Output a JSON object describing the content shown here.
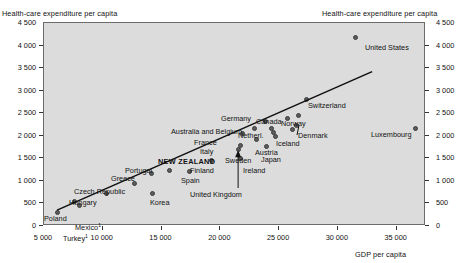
{
  "chart_data": {
    "type": "scatter",
    "title": "",
    "xlabel": "GDP per capita",
    "ylabel": "Health-care expenditure per capita",
    "ylabel_right": "Health-care expenditure per capita",
    "xlim": [
      5000,
      37500
    ],
    "ylim": [
      0,
      4500
    ],
    "xticks": [
      "5 000",
      "10 000",
      "15 000",
      "20 000",
      "25 000",
      "30 000",
      "35 000"
    ],
    "xtick_values": [
      5000,
      10000,
      15000,
      20000,
      25000,
      30000,
      35000
    ],
    "yticks": [
      "0",
      "500",
      "1 000",
      "1 500",
      "2 000",
      "2 500",
      "3 000",
      "3 500",
      "4 000",
      "4 500"
    ],
    "ytick_values": [
      0,
      500,
      1000,
      1500,
      2000,
      2500,
      3000,
      3500,
      4000,
      4500
    ],
    "grid": false,
    "legend": "none",
    "trendline": {
      "x0": 6200,
      "y0": 330,
      "x1": 33000,
      "y1": 3400
    },
    "highlight": "NEW ZEALAND",
    "footnote_marker": "1",
    "points": [
      {
        "label": "Turkey",
        "x": 6200,
        "y": 280,
        "sup": "1",
        "lx": 63,
        "ly": 233,
        "anchor": "below"
      },
      {
        "label": "Poland",
        "x": 7700,
        "y": 520,
        "lx": 44,
        "ly": 214,
        "anchor": "left"
      },
      {
        "label": "Mexico",
        "x": 8100,
        "y": 430,
        "sup": "1",
        "lx": 75,
        "ly": 222,
        "anchor": "right"
      },
      {
        "label": "Hungary",
        "x": 10400,
        "y": 700,
        "lx": 69,
        "ly": 198,
        "anchor": "left"
      },
      {
        "label": "Czech Republic",
        "x": 12800,
        "y": 920,
        "lx": 74,
        "ly": 187,
        "anchor": "left"
      },
      {
        "label": "Greece",
        "x": 14200,
        "y": 1150,
        "lx": 111,
        "ly": 174,
        "anchor": "left"
      },
      {
        "label": "Portugal",
        "x": 15800,
        "y": 1210,
        "lx": 125,
        "ly": 166,
        "anchor": "left"
      },
      {
        "label": "Korea",
        "x": 14300,
        "y": 700,
        "lx": 150,
        "ly": 198,
        "anchor": "right"
      },
      {
        "label": "Spain",
        "x": 17500,
        "y": 1190,
        "lx": 181,
        "ly": 176,
        "anchor": "right"
      },
      {
        "label": "NEW ZEALAND",
        "x": 19300,
        "y": 1430,
        "lx": 158,
        "ly": 157,
        "anchor": "left",
        "bold": true
      },
      {
        "label": "Finland",
        "x": 21800,
        "y": 1480,
        "lx": 190,
        "ly": 166,
        "anchor": "left"
      },
      {
        "label": "Italy",
        "x": 21800,
        "y": 1760,
        "lx": 200,
        "ly": 147,
        "anchor": "left"
      },
      {
        "label": "France",
        "x": 22000,
        "y": 2030,
        "lx": 194,
        "ly": 138,
        "anchor": "left"
      },
      {
        "label": "United Kingdom",
        "x": 21600,
        "y": 1680,
        "lx": 190,
        "ly": 190,
        "anchor": "arrow"
      },
      {
        "label": "Australia and Belgium",
        "x": 23000,
        "y": 2130,
        "lx": 171,
        "ly": 127,
        "anchor": "left"
      },
      {
        "label": "Sweden",
        "x": 23200,
        "y": 1890,
        "lx": 225,
        "ly": 156,
        "anchor": "left"
      },
      {
        "label": "Ireland",
        "x": 24000,
        "y": 1740,
        "lx": 243,
        "ly": 166,
        "anchor": "right"
      },
      {
        "label": "Germany",
        "x": 23900,
        "y": 2300,
        "lx": 221,
        "ly": 114,
        "anchor": "left"
      },
      {
        "label": "Netherl.",
        "x": 24400,
        "y": 2150,
        "lx": 238,
        "ly": 131,
        "anchor": "left"
      },
      {
        "label": "Austria",
        "x": 24600,
        "y": 2060,
        "lx": 255,
        "ly": 148,
        "anchor": "left"
      },
      {
        "label": "Japan",
        "x": 24800,
        "y": 1970,
        "lx": 261,
        "ly": 155,
        "anchor": "left"
      },
      {
        "label": "Canada",
        "x": 25800,
        "y": 2350,
        "lx": 256,
        "ly": 117,
        "anchor": "left"
      },
      {
        "label": "Iceland",
        "x": 26200,
        "y": 2120,
        "lx": 276,
        "ly": 139,
        "anchor": "left"
      },
      {
        "label": "Denmark",
        "x": 26600,
        "y": 2200,
        "lx": 298,
        "ly": 131,
        "anchor": "leader"
      },
      {
        "label": "Norway",
        "x": 26700,
        "y": 2420,
        "lx": 281,
        "ly": 119,
        "anchor": "left"
      },
      {
        "label": "Switzerland",
        "x": 27400,
        "y": 2790,
        "lx": 308,
        "ly": 101,
        "anchor": "right"
      },
      {
        "label": "United States",
        "x": 31600,
        "y": 4150,
        "lx": 365,
        "ly": 43,
        "anchor": "right"
      },
      {
        "label": "Luxembourg",
        "x": 36700,
        "y": 2130,
        "lx": 371,
        "ly": 130,
        "anchor": "left"
      }
    ]
  }
}
